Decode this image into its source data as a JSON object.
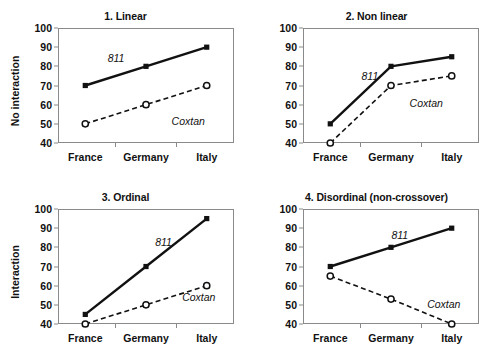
{
  "figure": {
    "width": 502,
    "height": 362,
    "background": "#ffffff",
    "layout": "2x2 grid of interaction line plots"
  },
  "axis": {
    "y_ticks": [
      100,
      90,
      80,
      70,
      60,
      50,
      40
    ],
    "y_min": 40,
    "y_max": 100,
    "categories": [
      "France",
      "Germany",
      "Italy"
    ],
    "ylabel_top": "No interaction",
    "ylabel_bottom": "Interaction",
    "axis_color": "#8a8a8a",
    "line_color": "#111111"
  },
  "series_names": {
    "solid": "811",
    "dashed": "Coxtan"
  },
  "chart_data": [
    {
      "type": "line",
      "title": "1. Linear",
      "xlabel": "",
      "ylabel": "No interaction",
      "categories": [
        "France",
        "Germany",
        "Italy"
      ],
      "ylim": [
        40,
        100
      ],
      "yticks": [
        40,
        50,
        60,
        70,
        80,
        90,
        100
      ],
      "grid": false,
      "legend": "inline annotations",
      "series": [
        {
          "name": "811",
          "values": [
            70,
            80,
            90
          ],
          "style": "solid",
          "marker": "filled-square",
          "label_x": "Germany-left",
          "label_value": 84
        },
        {
          "name": "Coxtan",
          "values": [
            50,
            60,
            70
          ],
          "style": "dashed",
          "marker": "open-circle",
          "label_x": "Italy-left",
          "label_value": 52
        }
      ]
    },
    {
      "type": "line",
      "title": "2. Non linear",
      "xlabel": "",
      "ylabel": "",
      "categories": [
        "France",
        "Germany",
        "Italy"
      ],
      "ylim": [
        40,
        100
      ],
      "yticks": [
        40,
        50,
        60,
        70,
        80,
        90,
        100
      ],
      "grid": false,
      "legend": "inline annotations",
      "series": [
        {
          "name": "811",
          "values": [
            50,
            80,
            85
          ],
          "style": "solid",
          "marker": "filled-square",
          "label_value": 75
        },
        {
          "name": "Coxtan",
          "values": [
            40,
            70,
            75
          ],
          "style": "dashed",
          "marker": "open-circle",
          "label_value": 61
        }
      ]
    },
    {
      "type": "line",
      "title": "3. Ordinal",
      "xlabel": "",
      "ylabel": "Interaction",
      "categories": [
        "France",
        "Germany",
        "Italy"
      ],
      "ylim": [
        40,
        100
      ],
      "yticks": [
        40,
        50,
        60,
        70,
        80,
        90,
        100
      ],
      "grid": false,
      "legend": "inline annotations",
      "series": [
        {
          "name": "811",
          "values": [
            45,
            70,
            95
          ],
          "style": "solid",
          "marker": "filled-square",
          "label_value": 83
        },
        {
          "name": "Coxtan",
          "values": [
            40,
            50,
            60
          ],
          "style": "dashed",
          "marker": "open-circle",
          "label_value": 54
        }
      ]
    },
    {
      "type": "line",
      "title": "4. Disordinal (non-crossover)",
      "xlabel": "",
      "ylabel": "",
      "categories": [
        "France",
        "Germany",
        "Italy"
      ],
      "ylim": [
        40,
        100
      ],
      "yticks": [
        40,
        50,
        60,
        70,
        80,
        90,
        100
      ],
      "grid": false,
      "legend": "inline annotations",
      "series": [
        {
          "name": "811",
          "values": [
            70,
            80,
            90
          ],
          "style": "solid",
          "marker": "filled-square",
          "label_value": 86
        },
        {
          "name": "Coxtan",
          "values": [
            65,
            53,
            40
          ],
          "style": "dashed",
          "marker": "open-circle",
          "label_value": 50
        }
      ]
    }
  ]
}
